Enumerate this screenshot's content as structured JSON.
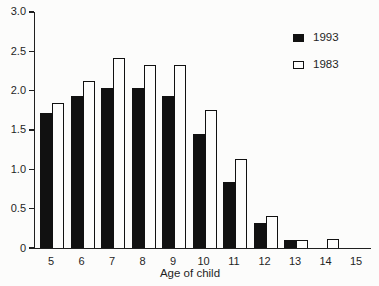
{
  "chart_data": {
    "type": "bar",
    "title": "",
    "xlabel": "Age of child",
    "ylabel": "",
    "categories": [
      "5",
      "6",
      "7",
      "8",
      "9",
      "10",
      "11",
      "12",
      "13",
      "14",
      "15"
    ],
    "series": [
      {
        "name": "1993",
        "style": "black",
        "values": [
          1.72,
          1.93,
          2.03,
          2.03,
          1.93,
          1.45,
          0.84,
          0.32,
          0.1,
          0,
          0
        ]
      },
      {
        "name": "1983",
        "style": "white",
        "values": [
          1.84,
          2.12,
          2.42,
          2.32,
          2.32,
          1.75,
          1.13,
          0.41,
          0.1,
          0.11,
          0
        ]
      }
    ],
    "ylim": [
      0,
      3.0
    ],
    "ytick_interval": 0.5,
    "yticks": [
      "0",
      "0.5",
      "1.0",
      "1.5",
      "2.0",
      "2.5",
      "3.0"
    ],
    "grid": false,
    "legend_position": "top-right",
    "bar_grouping": "paired-touching"
  },
  "colors": {
    "bar_1993": "#111111",
    "bar_1983": "#fdfdfc",
    "axis": "#1f1f1f",
    "text": "#1f1f1f",
    "background": "#fcfcfb"
  }
}
